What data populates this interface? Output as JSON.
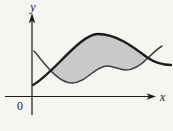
{
  "figure": {
    "axis_labels": {
      "x": "x",
      "y": "y"
    },
    "origin_label": "0",
    "colors": {
      "background": "#f5f5f2",
      "region_fill": "#c9c9c9",
      "upper_curve": "#1c1c1c",
      "lower_curve": "#3e3e3e",
      "axis": "#1c1c1c"
    }
  }
}
